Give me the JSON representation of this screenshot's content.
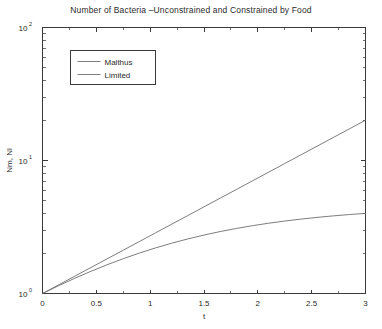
{
  "chart_data": {
    "type": "line",
    "title": "Number of Bacteria –Unconstrained and Constrained by Food",
    "xlabel": "t",
    "ylabel": "Nm, Nl",
    "yscale": "log",
    "xlim": [
      0,
      3
    ],
    "ylim": [
      1,
      100
    ],
    "grid": false,
    "legend_position": "upper-left-inside",
    "xticklabels": [
      "0",
      "0.5",
      "1",
      "1.5",
      "2",
      "2.5",
      "3"
    ],
    "xticks": [
      0,
      0.5,
      1,
      1.5,
      2,
      2.5,
      3
    ],
    "yticklabels": [
      "10^0",
      "10^1",
      "10^2"
    ],
    "yticks": [
      1,
      10,
      100
    ],
    "ytick_bases": [
      "10",
      "10",
      "10"
    ],
    "ytick_exponents": [
      "0",
      "1",
      "2"
    ],
    "x": [
      0,
      0.15,
      0.3,
      0.45,
      0.6,
      0.75,
      0.9,
      1.05,
      1.2,
      1.35,
      1.5,
      1.65,
      1.8,
      1.95,
      2.1,
      2.25,
      2.4,
      2.55,
      2.7,
      2.85,
      3
    ],
    "series": [
      {
        "name": "Malthus",
        "values": [
          1,
          1.162,
          1.35,
          1.568,
          1.822,
          2.117,
          2.46,
          2.858,
          3.32,
          3.857,
          4.482,
          5.207,
          6.05,
          7.029,
          8.166,
          9.488,
          11.023,
          12.807,
          14.88,
          17.288,
          20.086
        ]
      },
      {
        "name": "Limited",
        "values": [
          1,
          1.145,
          1.302,
          1.469,
          1.645,
          1.827,
          2.014,
          2.202,
          2.389,
          2.573,
          2.751,
          2.922,
          3.083,
          3.235,
          3.376,
          3.506,
          3.625,
          3.734,
          3.833,
          3.922,
          4.003
        ]
      }
    ],
    "legend": [
      {
        "label": "Malthus",
        "color": "#6e6e6e"
      },
      {
        "label": "Limited",
        "color": "#6e6e6e"
      }
    ],
    "colors": {
      "background": "#ffffff",
      "axis": "#3a3a3a",
      "curve": "#6e6e6e",
      "text": "#2b2b2b"
    }
  }
}
